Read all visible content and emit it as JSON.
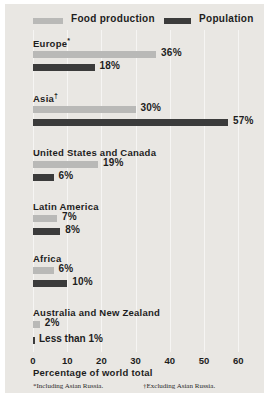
{
  "legend": {
    "food": {
      "label": "Food production",
      "color": "#b9b9b7",
      "swatch": "food-production-swatch"
    },
    "population": {
      "label": "Population",
      "color": "#3b3b3b",
      "swatch": "population-swatch"
    }
  },
  "axis": {
    "title": "Percentage of world total",
    "ticks": [
      "0",
      "10",
      "20",
      "30",
      "40",
      "50",
      "60"
    ],
    "min": 0,
    "max": 60
  },
  "groups": [
    {
      "name": "Europe*",
      "food": "36%",
      "population": "18%"
    },
    {
      "name": "Asia†",
      "food": "30%",
      "population": "57%"
    },
    {
      "name": "United States and Canada",
      "food": "19%",
      "population": "6%"
    },
    {
      "name": "Latin America",
      "food": "7%",
      "population": "8%"
    },
    {
      "name": "Africa",
      "food": "6%",
      "population": "10%"
    },
    {
      "name": "Australia and New Zealand",
      "food": "2%",
      "population": "Less than 1%"
    }
  ],
  "footnotes": [
    "*Including Asian Russia.",
    "†Excluding Asian Russia."
  ],
  "colors": {
    "background": "#e9e7e3",
    "gridline": "#f6f5f3",
    "text": "#1d1d1d"
  },
  "chart_data": {
    "type": "bar",
    "title": "",
    "orientation": "horizontal",
    "xlabel": "Percentage of world total",
    "ylabel": "",
    "xlim": [
      0,
      60
    ],
    "xticks": [
      0,
      10,
      20,
      30,
      40,
      50,
      60
    ],
    "grid": true,
    "legend_position": "top",
    "categories": [
      "Europe*",
      "Asia†",
      "United States and Canada",
      "Latin America",
      "Africa",
      "Australia and New Zealand"
    ],
    "series": [
      {
        "name": "Food production",
        "color": "#b9b9b7",
        "values": [
          36,
          30,
          19,
          7,
          6,
          2
        ],
        "labels": [
          "36%",
          "30%",
          "19%",
          "7%",
          "6%",
          "2%"
        ]
      },
      {
        "name": "Population",
        "color": "#3b3b3b",
        "values": [
          18,
          57,
          6,
          8,
          10,
          0.5
        ],
        "labels": [
          "18%",
          "57%",
          "6%",
          "8%",
          "10%",
          "Less than 1%"
        ]
      }
    ],
    "annotations": [
      "*Including Asian Russia.",
      "†Excluding Asian Russia."
    ]
  }
}
